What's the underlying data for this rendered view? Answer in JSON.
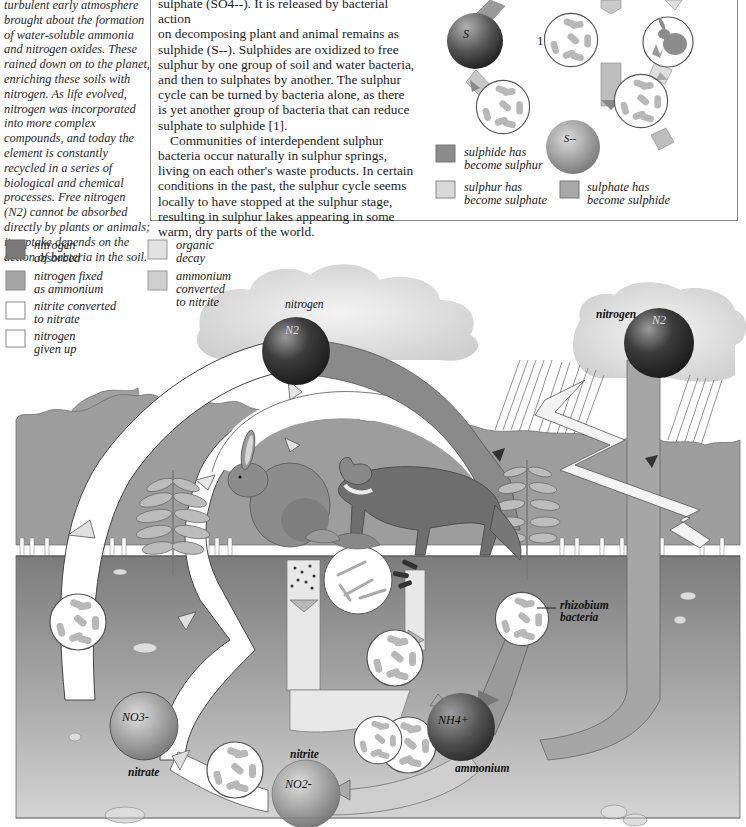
{
  "sidebar": {
    "lines": [
      "turbulent early atmosphere",
      "brought about the formation",
      "of water-soluble ammonia",
      "and nitrogen oxides. These",
      "rained down on to the planet,",
      "enriching these soils with",
      "nitrogen. As life evolved,",
      "nitrogen was incorporated",
      "into more complex",
      "compounds, and today the",
      "element is constantly",
      "recycled in a series of",
      "biological and chemical",
      "processes. Free nitrogen",
      "(N2) cannot be absorbed",
      "directly by plants or animals;",
      "its uptake depends on the",
      "action of bacteria in the soil."
    ]
  },
  "sulphur_box": {
    "paragraph1_lines": [
      "sulphate (SO4--). It is released by bacterial action",
      "on decomposing plant and animal remains as",
      "sulphide (S--). Sulphides are oxidized to free",
      "sulphur by one group of soil and water bacteria,",
      "and then to sulphates by another. The sulphur",
      "cycle can be turned by bacteria alone, as there",
      "is yet another group of bacteria that can reduce",
      "sulphate to sulphide [1]."
    ],
    "paragraph2_lines": [
      "Communities of interdependent sulphur",
      "bacteria occur naturally in sulphur springs,",
      "living on each other's waste products. In certain",
      "conditions in the past, the sulphur cycle seems",
      "locally to have stopped at the sulphur stage,",
      "resulting in sulphur lakes appearing in some",
      "warm, dry parts of the world."
    ],
    "diagram": {
      "sulphur_label": "S",
      "sulphide_label": "S--",
      "callout_number": "1"
    },
    "legend": [
      {
        "label_line1": "sulphide has",
        "label_line2": "become sulphur",
        "color": "#8c8c8c"
      },
      {
        "label_line1": "sulphur has",
        "label_line2": "become sulphate",
        "color": "#d8d8d8"
      },
      {
        "label_line1": "sulphate has",
        "label_line2": "become sulphide",
        "color": "#a8a8a8"
      }
    ]
  },
  "nitrogen_legend": [
    {
      "line1": "nitrogen",
      "line2": "absorbed",
      "line3": "",
      "color": "#7a7a7a"
    },
    {
      "line1": "nitrogen fixed",
      "line2": "as ammonium",
      "line3": "",
      "color": "#a6a6a6"
    },
    {
      "line1": "nitrite converted",
      "line2": "to nitrate",
      "line3": "",
      "color": "#ffffff"
    },
    {
      "line1": "nitrogen",
      "line2": "given up",
      "line3": "",
      "color": "#ffffff"
    },
    {
      "line1": "organic",
      "line2": "decay",
      "line3": "",
      "color": "#e2e2e2"
    },
    {
      "line1": "ammonium",
      "line2": "converted",
      "line3": "to nitrite",
      "color": "#cfcfcf"
    }
  ],
  "nitrogen_diagram": {
    "atmosphere_label_left": "nitrogen",
    "atmosphere_symbol_left": "N2",
    "atmosphere_label_right": "nitrogen",
    "atmosphere_symbol_right": "N2",
    "nitrate_symbol": "NO3-",
    "nitrate_label": "nitrate",
    "nitrite_symbol": "NO2-",
    "nitrite_label": "nitrite",
    "ammonium_symbol": "NH4+",
    "ammonium_label": "ammonium",
    "rhizobium_label_line1": "rhizobium",
    "rhizobium_label_line2": "bacteria"
  },
  "colors": {
    "sky_cloud": "#e6e6e6",
    "trees": "#9d9d9d",
    "soil_top": "#7d7d7d",
    "soil_bottom": "#cfcfcf",
    "sphere_dark": "#2e2e2e",
    "sphere_mid": "#8a8a8a",
    "band_absorbed": "#7a7a7a",
    "band_fixed": "#a6a6a6",
    "band_decay": "#e2e2e2",
    "band_white": "#ffffff"
  }
}
